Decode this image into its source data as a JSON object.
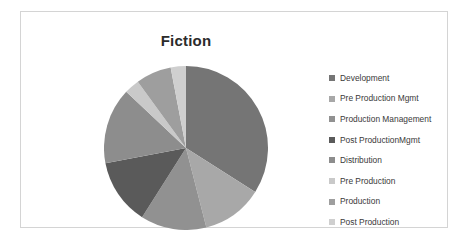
{
  "chart_data": {
    "type": "pie",
    "title": "Fiction",
    "xlabel": "",
    "ylabel": "",
    "legend_position": "right",
    "grid": false,
    "categories": [
      "Development",
      "Pre Production Mgmt",
      "Production Management",
      "Post ProductionMgmt",
      "Distribution",
      "Pre Production",
      "Production",
      "Post Production"
    ],
    "values": [
      34,
      12,
      13,
      13,
      15,
      3,
      7,
      3
    ],
    "colors": [
      "#757575",
      "#a8a8a8",
      "#919191",
      "#5a5a5a",
      "#8d8d8d",
      "#c9c9c9",
      "#9e9e9e",
      "#cfcfcf"
    ]
  },
  "legend": {
    "items": [
      {
        "label": "Development",
        "color": "#757575"
      },
      {
        "label": "Pre Production Mgmt",
        "color": "#a8a8a8"
      },
      {
        "label": "Production Management",
        "color": "#919191"
      },
      {
        "label": "Post ProductionMgmt",
        "color": "#5a5a5a"
      },
      {
        "label": "Distribution",
        "color": "#8d8d8d"
      },
      {
        "label": "Pre Production",
        "color": "#c9c9c9"
      },
      {
        "label": "Production",
        "color": "#9e9e9e"
      },
      {
        "label": "Post Production",
        "color": "#cfcfcf"
      }
    ]
  }
}
